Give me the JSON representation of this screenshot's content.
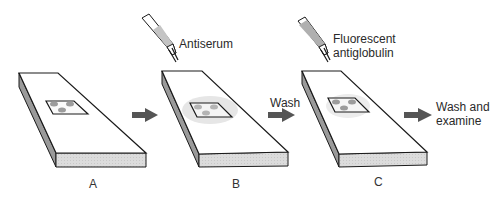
{
  "figure": {
    "steps": [
      {
        "id": "A",
        "label": "A",
        "reagent": null
      },
      {
        "id": "B",
        "label": "B",
        "reagent": "Antiserum"
      },
      {
        "id": "C",
        "label": "C",
        "reagent_line1": "Fluorescent",
        "reagent_line2": "antiglobulin"
      }
    ],
    "arrows": [
      {
        "from": "A",
        "to": "B",
        "label": ""
      },
      {
        "from": "B",
        "to": "C",
        "label": "Wash"
      },
      {
        "from": "C",
        "to": "end",
        "label_line1": "Wash and",
        "label_line2": "examine"
      }
    ],
    "colors": {
      "outline": "#1a1a1a",
      "slide_top": "#ffffff",
      "slide_front": "#d8d8d8",
      "slide_side": "#9a9a9a",
      "arrow": "#555555",
      "spot": "#9c9c9c",
      "halo": "#e6e6e6",
      "pipette_fluid": "#bdbdbd"
    }
  }
}
